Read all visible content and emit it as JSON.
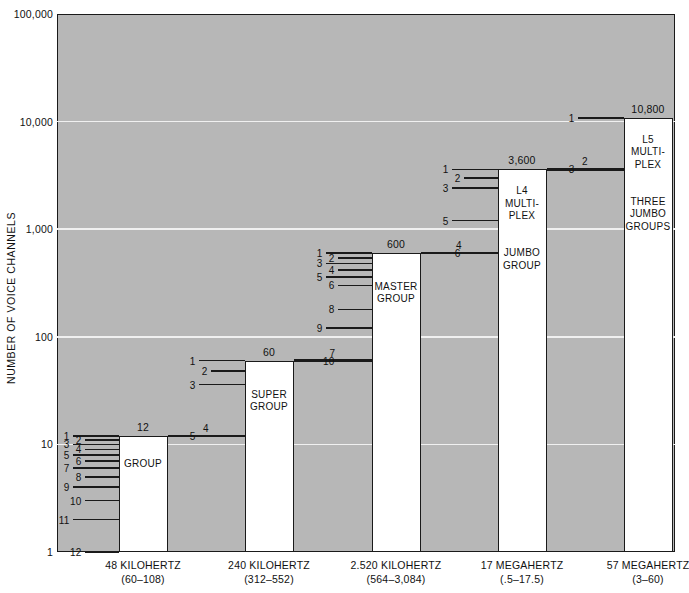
{
  "chart_data": {
    "type": "bar",
    "title": "",
    "xlabel": "",
    "ylabel": "NUMBER OF VOICE CHANNELS",
    "scale": "log",
    "ylim": [
      1,
      100000
    ],
    "grid": true,
    "legend": "none",
    "y_ticks": [
      "100,000",
      "10,000",
      "1,000",
      "100",
      "10",
      "1"
    ],
    "y_tick_values": [
      100000,
      10000,
      1000,
      100,
      10,
      1
    ],
    "categories": [
      "48 KILOHERTZ\n(60–108)",
      "240 KILOHERTZ\n(312–552)",
      "2.520 KILOHERTZ\n(564–3,084)",
      "17 MEGAHERTZ\n(.5–17.5)",
      "57 MEGAHERTZ\n(3–60)"
    ],
    "values": [
      12,
      60,
      600,
      3600,
      10800
    ],
    "value_labels": [
      "12",
      "60",
      "600",
      "3,600",
      "10,800"
    ],
    "bar_labels": [
      "GROUP",
      "SUPER\nGROUP",
      "MASTER\nGROUP",
      "L4\nMULTI-\nPLEX",
      "L5\nMULTI-\nPLEX"
    ],
    "bar_sublabels": [
      "",
      "",
      "",
      "JUMBO\nGROUP",
      "THREE\nJUMBO\nGROUPS"
    ],
    "subdivision_counts": [
      12,
      5,
      10,
      6,
      3
    ],
    "connector_index": [
      null,
      4,
      7,
      4,
      2
    ]
  },
  "axis": {
    "y_title": "NUMBER OF VOICE CHANNELS",
    "ticks": [
      {
        "label": "100,000",
        "value": 100000
      },
      {
        "label": "10,000",
        "value": 10000
      },
      {
        "label": "1,000",
        "value": 1000
      },
      {
        "label": "100",
        "value": 100
      },
      {
        "label": "10",
        "value": 10
      },
      {
        "label": "1",
        "value": 1
      }
    ]
  },
  "bars": [
    {
      "name": "group",
      "value_label": "12",
      "title": "GROUP",
      "subtitle": "",
      "x_label_line1": "48 KILOHERTZ",
      "x_label_line2": "(60–108)",
      "ticks": [
        "1",
        "2",
        "3",
        "4",
        "5",
        "6",
        "7",
        "8",
        "9",
        "10",
        "11",
        "12"
      ]
    },
    {
      "name": "super-group",
      "value_label": "60",
      "title": "SUPER\nGROUP",
      "subtitle": "",
      "x_label_line1": "240 KILOHERTZ",
      "x_label_line2": "(312–552)",
      "ticks": [
        "1",
        "2",
        "3",
        "4",
        "5"
      ]
    },
    {
      "name": "master-group",
      "value_label": "600",
      "title": "MASTER\nGROUP",
      "subtitle": "",
      "x_label_line1": "2.520 KILOHERTZ",
      "x_label_line2": "(564–3,084)",
      "ticks": [
        "1",
        "2",
        "3",
        "4",
        "5",
        "6",
        "7",
        "8",
        "9",
        "10"
      ]
    },
    {
      "name": "jumbo-group",
      "value_label": "3,600",
      "title": "L4\nMULTI-\nPLEX",
      "subtitle": "JUMBO\nGROUP",
      "x_label_line1": "17 MEGAHERTZ",
      "x_label_line2": "(.5–17.5)",
      "ticks": [
        "1",
        "2",
        "3",
        "4",
        "5",
        "6"
      ]
    },
    {
      "name": "three-jumbo-groups",
      "value_label": "10,800",
      "title": "L5\nMULTI-\nPLEX",
      "subtitle": "THREE\nJUMBO\nGROUPS",
      "x_label_line1": "57 MEGAHERTZ",
      "x_label_line2": "(3–60)",
      "ticks": [
        "1",
        "2",
        "3"
      ]
    }
  ],
  "connectors": [
    {
      "label": "4",
      "from_bar": 0,
      "to_bar": 1
    },
    {
      "label": "7",
      "from_bar": 1,
      "to_bar": 2
    },
    {
      "label": "4",
      "from_bar": 2,
      "to_bar": 3
    },
    {
      "label": "2",
      "from_bar": 3,
      "to_bar": 4
    }
  ],
  "colors": {
    "plot_background": "#b7b7b7",
    "bar_fill": "#ffffff",
    "ink": "#1a1a1a",
    "gridline": "#f0f0f0",
    "page_background": "#ffffff"
  },
  "caption": {
    "clipped_text": "—— — — —— — —  —  ——  —"
  }
}
